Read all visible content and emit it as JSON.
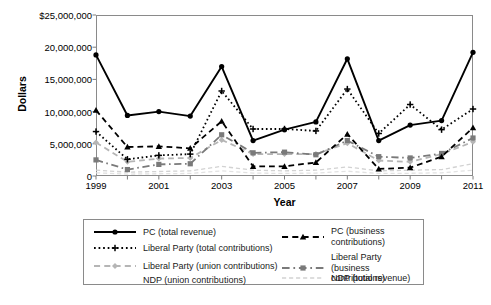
{
  "chart_data": {
    "type": "line",
    "title": "",
    "xlabel": "Year",
    "ylabel": "Dollars",
    "x": [
      1999,
      2000,
      2001,
      2002,
      2003,
      2004,
      2005,
      2006,
      2007,
      2008,
      2009,
      2010,
      2011
    ],
    "xlim": [
      1999,
      2011
    ],
    "ylim": [
      0,
      25000000
    ],
    "yticks": [
      0,
      5000000,
      10000000,
      15000000,
      20000000,
      25000000
    ],
    "ytick_labels": [
      "0",
      "5,000,000",
      "10,000,000",
      "15,000,000",
      "20,000,000",
      "$25,000,000"
    ],
    "xticks": [
      1999,
      2000,
      2001,
      2002,
      2003,
      2004,
      2005,
      2006,
      2007,
      2008,
      2009,
      2010,
      2011
    ],
    "xtick_labels": [
      "1999",
      "",
      "2001",
      "",
      "2003",
      "",
      "2005",
      "",
      "2007",
      "",
      "2009",
      "",
      "2011"
    ],
    "grid": false,
    "legend_position": "below-plot",
    "series": [
      {
        "name": "PC (total revenue)",
        "color": "#000000",
        "style": "solid",
        "marker": "circle",
        "values": [
          18800000,
          9400000,
          10000000,
          9300000,
          17000000,
          5500000,
          7200000,
          8400000,
          18200000,
          5500000,
          7900000,
          8600000,
          19200000
        ]
      },
      {
        "name": "PC (business contributions)",
        "color": "#000000",
        "style": "dashed",
        "marker": "triangle",
        "values": [
          10200000,
          4500000,
          4600000,
          4300000,
          8500000,
          1500000,
          1500000,
          2100000,
          6500000,
          1100000,
          1300000,
          3000000,
          7500000
        ]
      },
      {
        "name": "Liberal Party (total contributions)",
        "color": "#000000",
        "style": "dotted",
        "marker": "plus",
        "values": [
          6900000,
          2600000,
          3200000,
          3400000,
          13200000,
          7300000,
          7300000,
          7000000,
          13500000,
          6600000,
          11100000,
          7200000,
          10400000
        ]
      },
      {
        "name": "Liberal Party (business contributions)",
        "color": "#7a7a7a",
        "style": "dashdot",
        "marker": "square",
        "values": [
          2500000,
          1000000,
          1800000,
          1900000,
          6400000,
          3600000,
          3700000,
          3300000,
          5500000,
          3000000,
          2800000,
          3500000,
          5900000
        ]
      },
      {
        "name": "Liberal Party (union contributions)",
        "color": "#b5b5b5",
        "style": "dashed",
        "marker": "diamond",
        "values": [
          5200000,
          2200000,
          2700000,
          2800000,
          5600000,
          3400000,
          3400000,
          3400000,
          5100000,
          2400000,
          2200000,
          3400000,
          5300000
        ]
      },
      {
        "name": "NDP (total revenue)",
        "color": "#d2d2d2",
        "style": "dashed",
        "marker": "none",
        "values": [
          900000,
          600000,
          700000,
          800000,
          1500000,
          900000,
          800000,
          900000,
          1400000,
          800000,
          900000,
          1000000,
          1900000
        ]
      },
      {
        "name": "NDP (union contributions)",
        "color": "#e2e2e2",
        "style": "dashed",
        "marker": "none",
        "values": [
          500000,
          300000,
          350000,
          400000,
          800000,
          450000,
          400000,
          450000,
          750000,
          400000,
          420000,
          500000,
          900000
        ]
      }
    ]
  },
  "axis": {
    "ylabel": "Dollars",
    "xlabel": "Year"
  },
  "legend": {
    "entries": [
      {
        "label": "PC (total revenue)",
        "col": 0,
        "row": 0
      },
      {
        "label": "PC (business contributions)",
        "col": 1,
        "row": 0
      },
      {
        "label": "Liberal Party (total contributions)",
        "col": 0,
        "row": 1
      },
      {
        "label": "Liberal Party\n(business contributions)",
        "col": 1,
        "row": 1
      },
      {
        "label": "Liberal Party (union contributions)",
        "col": 0,
        "row": 2
      },
      {
        "label": "NDP (total revenue)",
        "col": 1,
        "row": 2
      },
      {
        "label": "NDP (union contributions)",
        "col": 0,
        "row": 3
      }
    ]
  }
}
